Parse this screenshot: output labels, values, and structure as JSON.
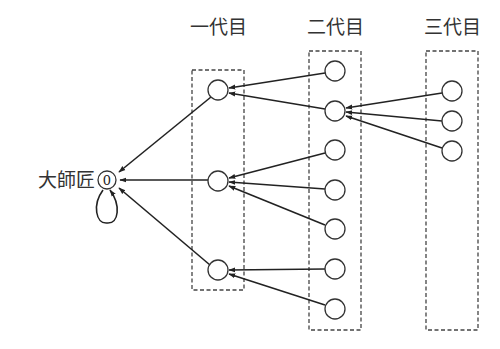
{
  "diagram": {
    "title": "",
    "root": {
      "label": "大師匠",
      "number": "0",
      "self_loop": true
    },
    "generations": [
      {
        "label": "一代目",
        "node_count": 3
      },
      {
        "label": "二代目",
        "node_count": 7
      },
      {
        "label": "三代目",
        "node_count": 3
      }
    ],
    "edges": [
      {
        "from": "gen2-1",
        "to": "gen1-1"
      },
      {
        "from": "gen2-2",
        "to": "gen1-1"
      },
      {
        "from": "gen2-3",
        "to": "gen1-2"
      },
      {
        "from": "gen2-4",
        "to": "gen1-2"
      },
      {
        "from": "gen2-5",
        "to": "gen1-2"
      },
      {
        "from": "gen2-6",
        "to": "gen1-3"
      },
      {
        "from": "gen2-7",
        "to": "gen1-3"
      },
      {
        "from": "gen3-1",
        "to": "gen2-2"
      },
      {
        "from": "gen3-2",
        "to": "gen2-2"
      },
      {
        "from": "gen3-3",
        "to": "gen2-2"
      },
      {
        "from": "gen1-1",
        "to": "root"
      },
      {
        "from": "gen1-2",
        "to": "root"
      },
      {
        "from": "gen1-3",
        "to": "root"
      },
      {
        "from": "root",
        "to": "root"
      }
    ],
    "colors": {
      "stroke": "#222222",
      "box": "#444444",
      "background": "#ffffff"
    }
  }
}
